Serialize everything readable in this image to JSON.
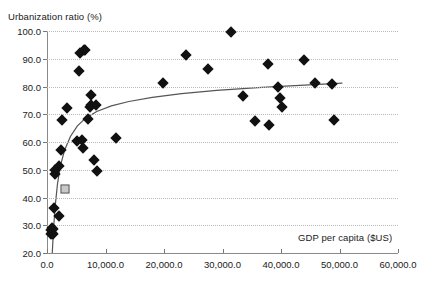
{
  "chart_data": {
    "type": "scatter",
    "title": "",
    "xlabel": "GDP per capita ($US)",
    "ylabel": "Urbanization ratio (%)",
    "xlim": [
      0,
      60000
    ],
    "ylim": [
      20,
      100
    ],
    "xticks": [
      0,
      10000,
      20000,
      30000,
      40000,
      50000,
      60000
    ],
    "xticklabels": [
      "0.0",
      "10,000.0",
      "20,000.0",
      "30,000.0",
      "40,000.0",
      "50,000.0",
      "60,000.0"
    ],
    "yticks": [
      20,
      30,
      40,
      50,
      60,
      70,
      80,
      90,
      100
    ],
    "yticklabels": [
      "20.0",
      "30.0",
      "40.0",
      "50.0",
      "60.0",
      "70.0",
      "80.0",
      "90.0",
      "100.0"
    ],
    "grid": "horizontal-dotted",
    "legend": "none",
    "series": [
      {
        "name": "countries",
        "marker": "diamond",
        "color": "#111111",
        "points": [
          [
            700,
            27.0
          ],
          [
            750,
            28.2
          ],
          [
            850,
            29.0
          ],
          [
            900,
            27.3
          ],
          [
            1000,
            28.6
          ],
          [
            1050,
            26.9
          ],
          [
            1200,
            36.2
          ],
          [
            1300,
            48.5
          ],
          [
            1400,
            49.8
          ],
          [
            2000,
            33.4
          ],
          [
            2100,
            51.3
          ],
          [
            2400,
            57.0
          ],
          [
            2600,
            67.8
          ],
          [
            3500,
            72.1
          ],
          [
            5200,
            60.3
          ],
          [
            5400,
            85.5
          ],
          [
            5600,
            91.9
          ],
          [
            5900,
            60.6
          ],
          [
            6100,
            58.0
          ],
          [
            6300,
            93.1
          ],
          [
            6500,
            93.0
          ],
          [
            7000,
            68.2
          ],
          [
            7300,
            72.6
          ],
          [
            7500,
            73.2
          ],
          [
            7600,
            77.1
          ],
          [
            8100,
            53.6
          ],
          [
            8300,
            73.3
          ],
          [
            8600,
            49.6
          ],
          [
            11800,
            61.3
          ],
          [
            19800,
            81.2
          ],
          [
            23800,
            91.5
          ],
          [
            27500,
            86.2
          ],
          [
            31500,
            99.6
          ],
          [
            33500,
            76.7
          ],
          [
            35500,
            67.5
          ],
          [
            37800,
            88.0
          ],
          [
            38000,
            66.3
          ],
          [
            39500,
            80.0
          ],
          [
            39800,
            76.0
          ],
          [
            40100,
            72.6
          ],
          [
            44000,
            89.5
          ],
          [
            45800,
            81.2
          ],
          [
            48800,
            81.0
          ],
          [
            49000,
            67.8
          ]
        ]
      },
      {
        "name": "highlighted",
        "marker": "square",
        "color": "#c9c9c9",
        "points": [
          [
            3050,
            43.0
          ]
        ]
      }
    ],
    "trendline": {
      "type": "logarithmic",
      "color": "#555555",
      "points": [
        [
          900,
          20.0
        ],
        [
          1100,
          28.0
        ],
        [
          1400,
          37.0
        ],
        [
          1800,
          45.0
        ],
        [
          2300,
          51.5
        ],
        [
          3000,
          57.0
        ],
        [
          4000,
          62.0
        ],
        [
          5200,
          65.8
        ],
        [
          6600,
          68.6
        ],
        [
          8500,
          71.0
        ],
        [
          11000,
          73.0
        ],
        [
          14000,
          74.6
        ],
        [
          18000,
          76.1
        ],
        [
          23000,
          77.4
        ],
        [
          29000,
          78.6
        ],
        [
          36000,
          79.6
        ],
        [
          44000,
          80.5
        ],
        [
          50500,
          81.2
        ]
      ]
    }
  }
}
